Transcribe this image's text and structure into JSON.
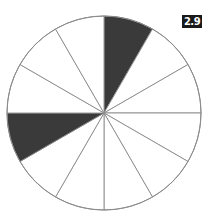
{
  "figure": {
    "label": "2.9",
    "total_sectors": 12,
    "shaded_sectors": [
      0,
      8
    ],
    "shaded_fraction": "2/12",
    "colors": {
      "shaded": "#3a3a3a",
      "unshaded": "#ffffff",
      "stroke": "#8a8a8a",
      "label_bg": "#1a1a1a",
      "label_text": "#ffffff"
    }
  }
}
